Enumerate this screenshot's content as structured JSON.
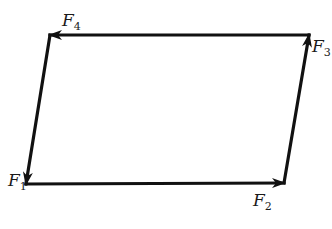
{
  "diagram": {
    "type": "force vector parallelogram",
    "stroke_color": "#111111",
    "background": "#ffffff",
    "vertices": {
      "top_left": [
        50,
        35
      ],
      "top_right": [
        309,
        35
      ],
      "bottom_left": [
        26,
        184
      ],
      "bottom_right": [
        284,
        183
      ]
    },
    "vectors": [
      {
        "name": "F1-to-F2",
        "from": "bottom_left",
        "to": "bottom_right",
        "direction": "right"
      },
      {
        "name": "F2-to-F3",
        "from": "bottom_right",
        "to": "top_right",
        "direction": "up"
      },
      {
        "name": "F3-to-F4",
        "from": "top_right",
        "to": "top_left",
        "direction": "left"
      },
      {
        "name": "F4-to-F1",
        "from": "top_left",
        "to": "bottom_left",
        "direction": "down"
      }
    ],
    "labels": [
      {
        "id": "F1",
        "letter": "F",
        "sub": "1",
        "x": 8,
        "y": 172
      },
      {
        "id": "F2",
        "letter": "F",
        "sub": "2",
        "x": 253,
        "y": 192
      },
      {
        "id": "F3",
        "letter": "F",
        "sub": "3",
        "x": 312,
        "y": 38
      },
      {
        "id": "F4",
        "letter": "F",
        "sub": "4",
        "x": 62,
        "y": 12
      }
    ]
  }
}
